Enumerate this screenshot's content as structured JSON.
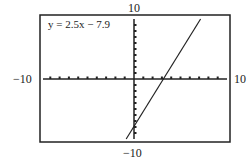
{
  "chart_data": {
    "type": "line",
    "title": "",
    "equation_label": "y = 2.5x − 7.9",
    "function": {
      "slope": 2.5,
      "intercept": -7.9
    },
    "series": [
      {
        "name": "y = 2.5x − 7.9",
        "x": [
          -0.84,
          7.16
        ],
        "y": [
          -10,
          10
        ]
      }
    ],
    "xlim": [
      -10,
      10
    ],
    "ylim": [
      -10,
      10
    ],
    "xscale_ticks": 1,
    "yscale_ticks": 1,
    "tick_labels": {
      "xmin": "−10",
      "xmax": "10",
      "ymin": "−10",
      "ymax": "10"
    },
    "xlabel": "",
    "ylabel": "",
    "grid": false
  }
}
